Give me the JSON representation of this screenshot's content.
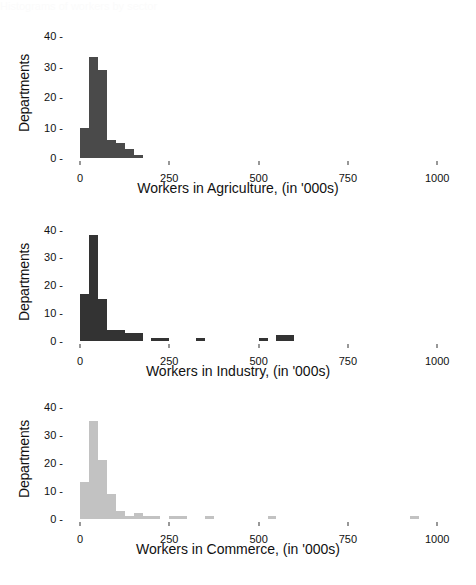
{
  "figure": {
    "background": "#ffffff",
    "width": 476,
    "height": 585,
    "clipped_top_text": "Histograms of workers by sector"
  },
  "axis": {
    "y_ticks": [
      "0",
      "10",
      "20",
      "30",
      "40"
    ],
    "x_ticks": [
      "0",
      "250",
      "500",
      "750",
      "1000"
    ],
    "y_label": "Departments",
    "tick_dash": "-"
  },
  "chart_data": [
    {
      "type": "bar",
      "title": "",
      "xlabel": "Workers in Agriculture, (in '000s)",
      "ylabel": "Departments",
      "xlim": [
        0,
        1060
      ],
      "ylim": [
        0,
        42
      ],
      "xticks": [
        0,
        250,
        500,
        750,
        1000
      ],
      "yticks": [
        0,
        10,
        20,
        30,
        40
      ],
      "grid": false,
      "bin_width": 25,
      "color": "#4a4a4a",
      "bin_starts": [
        0,
        25,
        50,
        75,
        100,
        125,
        150
      ],
      "values": [
        10,
        33,
        29,
        6,
        5,
        3,
        1
      ]
    },
    {
      "type": "bar",
      "title": "",
      "xlabel": "Workers in Industry, (in '000s)",
      "ylabel": "Departments",
      "xlim": [
        0,
        1060
      ],
      "ylim": [
        0,
        42
      ],
      "xticks": [
        0,
        250,
        500,
        750,
        1000
      ],
      "yticks": [
        0,
        10,
        20,
        30,
        40
      ],
      "grid": false,
      "bin_width": 25,
      "color": "#333333",
      "bin_starts": [
        0,
        25,
        50,
        75,
        100,
        125,
        150,
        200,
        225,
        325,
        500,
        550,
        575
      ],
      "values": [
        17,
        38,
        15,
        4,
        4,
        3,
        3,
        1,
        1,
        1,
        1,
        2,
        2
      ]
    },
    {
      "type": "bar",
      "title": "",
      "xlabel": "Workers in Commerce, (in '000s)",
      "ylabel": "Departments",
      "xlim": [
        0,
        1060
      ],
      "ylim": [
        0,
        42
      ],
      "xticks": [
        0,
        250,
        500,
        750,
        1000
      ],
      "yticks": [
        0,
        10,
        20,
        30,
        40
      ],
      "grid": false,
      "bin_width": 25,
      "color": "#c2c2c2",
      "bin_starts": [
        0,
        25,
        50,
        75,
        100,
        125,
        150,
        175,
        200,
        250,
        275,
        350,
        525,
        925
      ],
      "values": [
        13,
        35,
        21,
        9,
        3,
        1,
        2,
        1,
        1,
        1,
        1,
        1,
        1,
        1
      ]
    }
  ]
}
